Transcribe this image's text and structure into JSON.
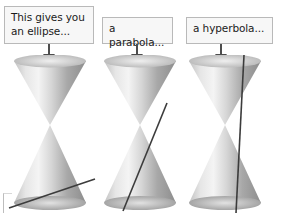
{
  "canvas": {
    "width": 282,
    "height": 213,
    "background": "#ffffff"
  },
  "palette": {
    "callout_fill": "#f7f7f7",
    "callout_border": "#b9b9b9",
    "text": "#1b1b1b",
    "arrow": "#4d4d4d",
    "cone_light": "#f2f2f2",
    "cone_mid": "#c9c9c9",
    "cone_dark": "#8e8e8e",
    "cut_line": "#3c3c3c"
  },
  "callouts": [
    {
      "id": "ellipse",
      "text": "This gives you\nan ellipse..."
    },
    {
      "id": "parabola",
      "text": "a parabola..."
    },
    {
      "id": "hyperbola",
      "text": "a hyperbola..."
    }
  ],
  "arrows": [
    {
      "id": "arrow-ellipse",
      "direction": "down"
    },
    {
      "id": "arrow-parabola",
      "direction": "down"
    },
    {
      "id": "arrow-hyperbola",
      "direction": "down"
    }
  ],
  "figures": [
    {
      "id": "ellipse",
      "shape": "double-cone",
      "cut_label": "ellipse",
      "cut_description": "shallow oblique plane cutting only the lower nappe"
    },
    {
      "id": "parabola",
      "shape": "double-cone",
      "cut_label": "parabola",
      "cut_description": "plane parallel to a generating line of the cone"
    },
    {
      "id": "hyperbola",
      "shape": "double-cone",
      "cut_label": "hyperbola",
      "cut_description": "near-vertical plane cutting both nappes"
    }
  ],
  "corner_mark": {
    "present": true
  }
}
